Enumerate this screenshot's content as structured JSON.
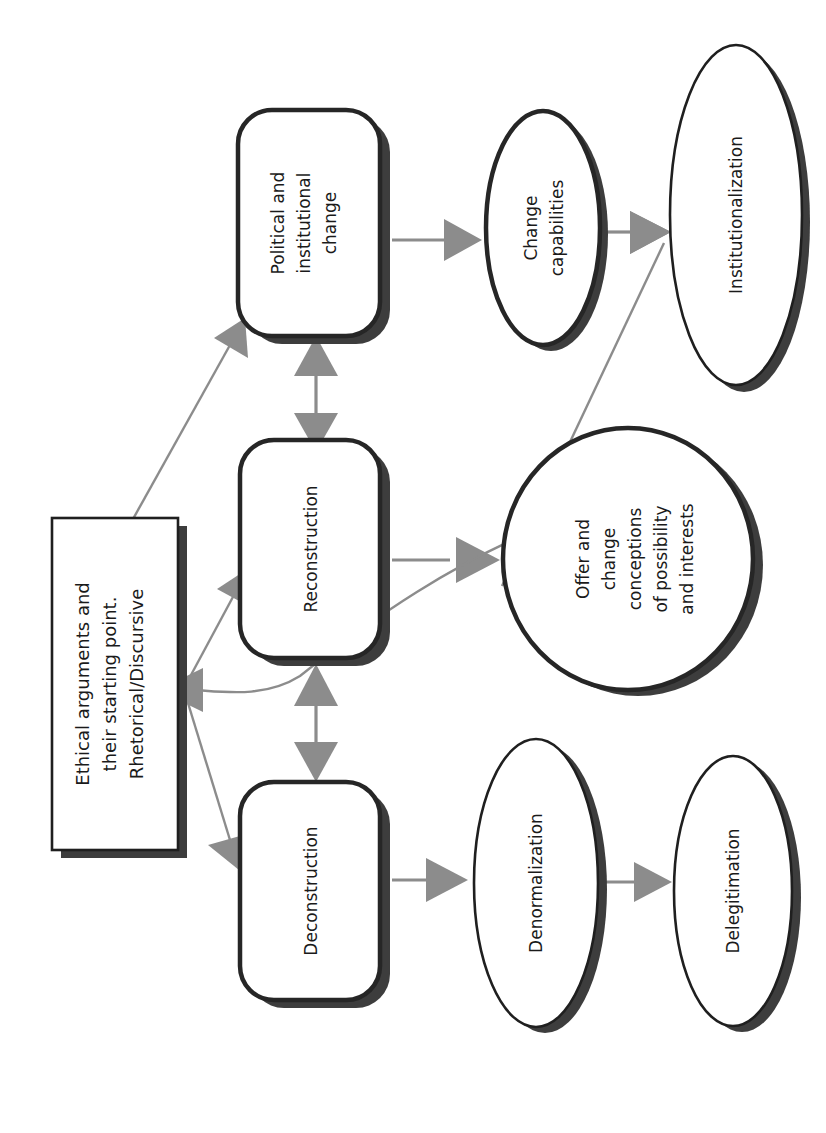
{
  "diagram": {
    "orientation": "rotated-90-ccw",
    "colors": {
      "shape_border": "#262626",
      "shape_shadow": "#3d3d3d",
      "shape_fill": "#ffffff",
      "connector": "#8c8c8c",
      "text": "#1a1a1a",
      "background": "#ffffff"
    },
    "nodes": {
      "source_box": {
        "shape": "rectangle-with-shadow",
        "lines": [
          "Ethical arguments and",
          "their starting point.",
          "Rhetorical/Discursive"
        ]
      },
      "political": {
        "shape": "rounded-rectangle",
        "lines": [
          "Political and",
          "institutional",
          "change"
        ]
      },
      "reconstruction": {
        "shape": "rounded-rectangle",
        "lines": [
          "Reconstruction"
        ]
      },
      "deconstruction": {
        "shape": "rounded-rectangle",
        "lines": [
          "Deconstruction"
        ]
      },
      "change_capabilities": {
        "shape": "ellipse",
        "lines": [
          "Change",
          "capabilities"
        ]
      },
      "institutionalization": {
        "shape": "ellipse",
        "lines": [
          "Institutionalization"
        ]
      },
      "offer_change": {
        "shape": "ellipse",
        "lines": [
          "Offer and",
          "change",
          "conceptions",
          "of possibility",
          "and interests"
        ]
      },
      "denormalization": {
        "shape": "ellipse",
        "lines": [
          "Denormalization"
        ]
      },
      "delegitimation": {
        "shape": "ellipse",
        "lines": [
          "Delegitimation"
        ]
      }
    },
    "edges": [
      {
        "from": "source_box",
        "to": "political",
        "style": "single-arrow"
      },
      {
        "from": "source_box",
        "to": "reconstruction",
        "style": "single-arrow"
      },
      {
        "from": "source_box",
        "to": "deconstruction",
        "style": "single-arrow"
      },
      {
        "from": "political",
        "to": "reconstruction",
        "style": "double-arrow"
      },
      {
        "from": "reconstruction",
        "to": "deconstruction",
        "style": "double-arrow"
      },
      {
        "from": "political",
        "to": "change_capabilities",
        "style": "single-arrow"
      },
      {
        "from": "change_capabilities",
        "to": "institutionalization",
        "style": "single-arrow"
      },
      {
        "from": "reconstruction",
        "to": "offer_change",
        "style": "single-arrow"
      },
      {
        "from": "deconstruction",
        "to": "denormalization",
        "style": "single-arrow"
      },
      {
        "from": "denormalization",
        "to": "delegitimation",
        "style": "single-arrow"
      },
      {
        "from": "offer_change",
        "to": "source_box",
        "style": "curved-single-arrow"
      },
      {
        "from": "offer_change",
        "to": "institutionalization",
        "style": "long-single-arrow"
      }
    ]
  }
}
